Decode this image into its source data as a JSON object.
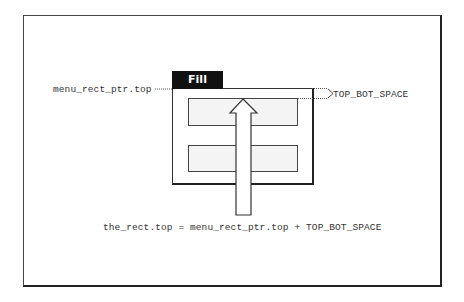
{
  "diagram": {
    "menu_tab": {
      "label": "Fill"
    },
    "labels": {
      "left": "menu_rect_ptr.top",
      "right": "TOP_BOT_SPACE",
      "formula": "the_rect.top = menu_rect_ptr.top + TOP_BOT_SPACE"
    },
    "colors": {
      "frame": "#333333",
      "tab_bg": "#111111",
      "tab_text": "#ffffff",
      "text": "#333333",
      "stipple": "#777777"
    }
  }
}
